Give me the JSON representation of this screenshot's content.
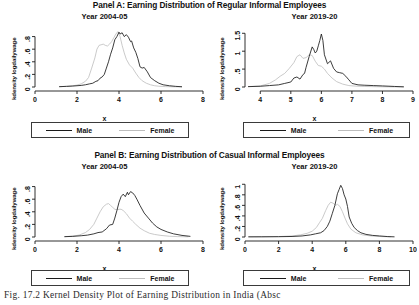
{
  "figure": {
    "caption": "Fig. 17.2    Kernel Density Plot of Earning Distribution in India (Absc",
    "legend": {
      "male_label": "Male",
      "female_label": "Female"
    },
    "colors": {
      "male": "#1a1a1a",
      "female": "#c0c0c0",
      "axis": "#1a1a1a",
      "background": "#ffffff"
    }
  },
  "panels": [
    {
      "title": "Panel A: Earning Distribution of Regular Informal Employees",
      "subplots": [
        "left_a",
        "right_a"
      ]
    },
    {
      "title": "Panel B: Earning Distribution of Casual Informal Employees",
      "subplots": [
        "left_b",
        "right_b"
      ]
    }
  ],
  "chart_data": [
    {
      "id": "left_a",
      "type": "line",
      "title": "Year 2004-05",
      "panel": "Panel A: Earning Distribution of Regular Informal Employees",
      "xlabel": "x",
      "ylabel": "kdensity logdailywage",
      "xlim": [
        0,
        8
      ],
      "ylim": [
        0,
        0.92
      ],
      "xticks": [
        0,
        2,
        4,
        6,
        8
      ],
      "xticklabels": [
        "0",
        "2",
        "4",
        "6",
        "8"
      ],
      "yticks": [
        0,
        0.2,
        0.4,
        0.6,
        0.8
      ],
      "yticklabels": [
        "0",
        ".2",
        ".4",
        ".6",
        ".8"
      ],
      "grid": false,
      "legend_position": "below",
      "series": [
        {
          "name": "Male",
          "x": [
            1.15,
            1.5,
            1.8,
            2.0,
            2.2,
            2.4,
            2.6,
            2.75,
            2.9,
            3.0,
            3.1,
            3.2,
            3.3,
            3.4,
            3.5,
            3.6,
            3.7,
            3.8,
            3.9,
            4.0,
            4.05,
            4.15,
            4.25,
            4.35,
            4.45,
            4.55,
            4.6,
            4.7,
            4.8,
            4.9,
            5.0,
            5.1,
            5.2,
            5.35,
            5.5,
            5.7,
            5.9,
            6.1,
            6.4,
            6.7,
            7.0
          ],
          "y": [
            0.005,
            0.01,
            0.015,
            0.02,
            0.025,
            0.035,
            0.05,
            0.06,
            0.09,
            0.1,
            0.14,
            0.16,
            0.2,
            0.3,
            0.4,
            0.52,
            0.62,
            0.75,
            0.8,
            0.87,
            0.84,
            0.86,
            0.8,
            0.83,
            0.79,
            0.72,
            0.73,
            0.62,
            0.55,
            0.45,
            0.32,
            0.3,
            0.31,
            0.24,
            0.15,
            0.1,
            0.06,
            0.035,
            0.02,
            0.01,
            0.004
          ]
        },
        {
          "name": "Female",
          "x": [
            1.15,
            1.5,
            1.8,
            2.0,
            2.2,
            2.4,
            2.55,
            2.7,
            2.85,
            2.95,
            3.05,
            3.15,
            3.25,
            3.35,
            3.45,
            3.55,
            3.65,
            3.75,
            3.85,
            3.95,
            4.05,
            4.15,
            4.25,
            4.35,
            4.5,
            4.65,
            4.8,
            4.95,
            5.1,
            5.3,
            5.5,
            5.7,
            5.9,
            6.2,
            6.6,
            7.0
          ],
          "y": [
            0.005,
            0.01,
            0.02,
            0.03,
            0.05,
            0.09,
            0.15,
            0.3,
            0.46,
            0.6,
            0.66,
            0.67,
            0.68,
            0.66,
            0.65,
            0.68,
            0.72,
            0.78,
            0.84,
            0.88,
            0.8,
            0.66,
            0.54,
            0.44,
            0.35,
            0.3,
            0.22,
            0.15,
            0.1,
            0.06,
            0.035,
            0.02,
            0.012,
            0.006,
            0.003,
            0.002
          ]
        }
      ]
    },
    {
      "id": "right_a",
      "type": "line",
      "title": "Year 2019-20",
      "panel": "Panel A: Earning Distribution of Regular Informal Employees",
      "xlabel": "x",
      "ylabel": "kdensity logdailywage",
      "xlim": [
        3.5,
        9
      ],
      "ylim": [
        0,
        1.62
      ],
      "xticks": [
        4,
        5,
        6,
        7,
        8,
        9
      ],
      "xticklabels": [
        "4",
        "5",
        "6",
        "7",
        "8",
        "9"
      ],
      "yticks": [
        0,
        0.5,
        1,
        1.5
      ],
      "yticklabels": [
        "0",
        ".5",
        "1",
        "1.5"
      ],
      "grid": false,
      "legend_position": "below",
      "series": [
        {
          "name": "Male",
          "x": [
            3.6,
            4.0,
            4.3,
            4.6,
            4.8,
            5.0,
            5.1,
            5.2,
            5.3,
            5.4,
            5.45,
            5.5,
            5.6,
            5.7,
            5.75,
            5.8,
            5.85,
            5.9,
            5.95,
            6.0,
            6.05,
            6.1,
            6.2,
            6.3,
            6.4,
            6.5,
            6.6,
            6.7,
            6.8,
            6.9,
            7.0,
            7.2,
            7.4,
            7.7,
            8.0,
            8.4,
            8.7
          ],
          "y": [
            0.01,
            0.02,
            0.04,
            0.06,
            0.1,
            0.14,
            0.25,
            0.28,
            0.22,
            0.35,
            0.38,
            0.55,
            0.85,
            1.12,
            1.05,
            0.95,
            1.0,
            1.15,
            1.3,
            1.48,
            1.3,
            0.9,
            0.65,
            0.73,
            0.52,
            0.42,
            0.4,
            0.38,
            0.3,
            0.2,
            0.1,
            0.06,
            0.05,
            0.04,
            0.03,
            0.015,
            0.005
          ]
        },
        {
          "name": "Female",
          "x": [
            3.6,
            4.0,
            4.3,
            4.5,
            4.65,
            4.8,
            4.95,
            5.1,
            5.2,
            5.3,
            5.4,
            5.5,
            5.6,
            5.7,
            5.8,
            5.9,
            6.0,
            6.1,
            6.2,
            6.35,
            6.5,
            6.7,
            6.9,
            7.1,
            7.4,
            7.8,
            8.2,
            8.7
          ],
          "y": [
            0.01,
            0.03,
            0.1,
            0.2,
            0.3,
            0.38,
            0.52,
            0.68,
            0.85,
            0.9,
            0.8,
            0.82,
            0.9,
            0.88,
            0.72,
            0.6,
            0.58,
            0.5,
            0.38,
            0.25,
            0.15,
            0.08,
            0.04,
            0.025,
            0.015,
            0.008,
            0.004,
            0.002
          ]
        }
      ]
    },
    {
      "id": "left_b",
      "type": "line",
      "title": "Year 2004-05",
      "panel": "Panel B: Earning Distribution of Casual Informal Employees",
      "xlabel": "x",
      "ylabel": "kdensity logdailywage",
      "xlim": [
        0,
        8
      ],
      "ylim": [
        0,
        0.92
      ],
      "xticks": [
        0,
        2,
        4,
        6,
        8
      ],
      "xticklabels": [
        "0",
        "2",
        "4",
        "6",
        "8"
      ],
      "yticks": [
        0,
        0.2,
        0.4,
        0.6,
        0.8
      ],
      "yticklabels": [
        "0",
        ".2",
        ".4",
        ".6",
        ".8"
      ],
      "grid": false,
      "legend_position": "below",
      "series": [
        {
          "name": "Male",
          "x": [
            1.4,
            1.8,
            2.2,
            2.5,
            2.8,
            3.0,
            3.2,
            3.4,
            3.55,
            3.7,
            3.8,
            3.9,
            4.0,
            4.1,
            4.2,
            4.3,
            4.4,
            4.45,
            4.55,
            4.65,
            4.75,
            4.85,
            5.0,
            5.2,
            5.4,
            5.6,
            5.8,
            6.0,
            6.3,
            6.6,
            7.0,
            7.4
          ],
          "y": [
            0.005,
            0.01,
            0.02,
            0.03,
            0.05,
            0.07,
            0.08,
            0.13,
            0.19,
            0.2,
            0.3,
            0.42,
            0.55,
            0.64,
            0.68,
            0.64,
            0.71,
            0.67,
            0.72,
            0.7,
            0.66,
            0.6,
            0.5,
            0.38,
            0.3,
            0.22,
            0.16,
            0.12,
            0.08,
            0.05,
            0.025,
            0.01
          ]
        },
        {
          "name": "Female",
          "x": [
            1.4,
            1.8,
            2.1,
            2.4,
            2.6,
            2.8,
            2.95,
            3.1,
            3.25,
            3.4,
            3.5,
            3.6,
            3.7,
            3.8,
            3.9,
            4.0,
            4.1,
            4.2,
            4.35,
            4.5,
            4.65,
            4.8,
            5.0,
            5.2,
            5.45,
            5.7,
            6.0,
            6.4,
            6.8,
            7.3
          ],
          "y": [
            0.005,
            0.015,
            0.03,
            0.07,
            0.12,
            0.2,
            0.3,
            0.4,
            0.48,
            0.52,
            0.53,
            0.5,
            0.47,
            0.44,
            0.43,
            0.44,
            0.44,
            0.42,
            0.37,
            0.3,
            0.25,
            0.2,
            0.14,
            0.1,
            0.06,
            0.04,
            0.025,
            0.012,
            0.006,
            0.003
          ]
        }
      ]
    },
    {
      "id": "right_b",
      "type": "line",
      "title": "Year 2019-20",
      "panel": "Panel B: Earning Distribution of Casual Informal Employees",
      "xlabel": "x",
      "ylabel": "kdensity logdailywage",
      "xlim": [
        0,
        10
      ],
      "ylim": [
        0,
        1.1
      ],
      "xticks": [
        0,
        2,
        4,
        6,
        8,
        10
      ],
      "xticklabels": [
        "0",
        "2",
        "4",
        "6",
        "8",
        "10"
      ],
      "yticks": [
        0,
        0.2,
        0.4,
        0.6,
        0.8,
        1
      ],
      "yticklabels": [
        "0",
        ".2",
        ".4",
        ".6",
        ".8",
        "1"
      ],
      "grid": false,
      "legend_position": "below",
      "series": [
        {
          "name": "Male",
          "x": [
            0.2,
            1.0,
            2.0,
            2.8,
            3.4,
            3.9,
            4.2,
            4.5,
            4.7,
            4.9,
            5.05,
            5.2,
            5.35,
            5.5,
            5.6,
            5.7,
            5.8,
            5.9,
            6.0,
            6.1,
            6.2,
            6.35,
            6.5,
            6.7,
            6.9,
            7.2,
            7.6,
            8.0,
            8.5,
            8.9
          ],
          "y": [
            0.003,
            0.004,
            0.006,
            0.01,
            0.02,
            0.04,
            0.06,
            0.08,
            0.12,
            0.2,
            0.3,
            0.45,
            0.6,
            0.82,
            0.9,
            0.98,
            0.92,
            0.8,
            0.72,
            0.58,
            0.38,
            0.26,
            0.18,
            0.12,
            0.08,
            0.05,
            0.03,
            0.02,
            0.008,
            0.003
          ]
        },
        {
          "name": "Female",
          "x": [
            0.2,
            1.0,
            2.0,
            2.8,
            3.3,
            3.7,
            4.0,
            4.25,
            4.45,
            4.6,
            4.8,
            4.95,
            5.1,
            5.25,
            5.4,
            5.5,
            5.65,
            5.8,
            5.95,
            6.1,
            6.3,
            6.6,
            7.0,
            7.5,
            8.1,
            8.7
          ],
          "y": [
            0.003,
            0.004,
            0.008,
            0.02,
            0.04,
            0.07,
            0.11,
            0.18,
            0.28,
            0.35,
            0.5,
            0.6,
            0.66,
            0.64,
            0.6,
            0.62,
            0.58,
            0.48,
            0.36,
            0.25,
            0.15,
            0.08,
            0.04,
            0.02,
            0.008,
            0.003
          ]
        }
      ]
    }
  ]
}
